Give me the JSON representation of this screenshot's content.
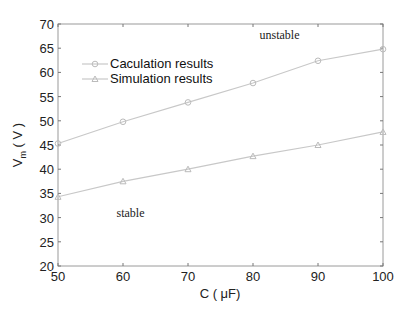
{
  "chart_data": {
    "type": "line",
    "title": "",
    "xlabel": "C ( μF)",
    "ylabel": "V_m ( V )",
    "ylabel_main": "V",
    "ylabel_sub": "m",
    "ylabel_unit": " ( V )",
    "x": [
      50,
      60,
      70,
      80,
      90,
      100
    ],
    "xlim": [
      50,
      100
    ],
    "ylim": [
      20,
      70
    ],
    "xticks": [
      50,
      60,
      70,
      80,
      90,
      100
    ],
    "yticks": [
      20,
      25,
      30,
      35,
      40,
      45,
      50,
      55,
      60,
      65,
      70
    ],
    "grid": false,
    "legend_position": "upper left",
    "series": [
      {
        "name": "Caculation results",
        "marker": "circle",
        "values": [
          45.3,
          49.8,
          53.8,
          57.8,
          62.4,
          64.8
        ]
      },
      {
        "name": "Simulation results",
        "marker": "triangle",
        "values": [
          34.3,
          37.5,
          40.0,
          42.7,
          45.0,
          47.7
        ]
      }
    ],
    "annotations": [
      {
        "text": "unstable",
        "x": 81,
        "y": 67
      },
      {
        "text": "stable",
        "x": 59,
        "y": 30.2
      }
    ],
    "line_color": "#c8c8c8"
  }
}
